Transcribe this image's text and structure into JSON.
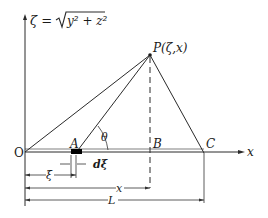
{
  "diagram": {
    "axis_label_vertical": "ζ = √(y² + z²)",
    "axis_label_vertical_parts": {
      "lhs": "ζ = ",
      "radicand": "y² + z²"
    },
    "axis_label_horizontal": "x",
    "origin_label": "O",
    "point_P_label": "P(ζ,x)",
    "point_A_label": "A",
    "point_B_label": "B",
    "point_C_label": "C",
    "angle_label": "θ",
    "element_label": "dξ",
    "dimensions": {
      "xi": "ξ",
      "x": "x",
      "L": "L"
    },
    "line_color": "#2a2a2a",
    "element_color": "#000000"
  }
}
